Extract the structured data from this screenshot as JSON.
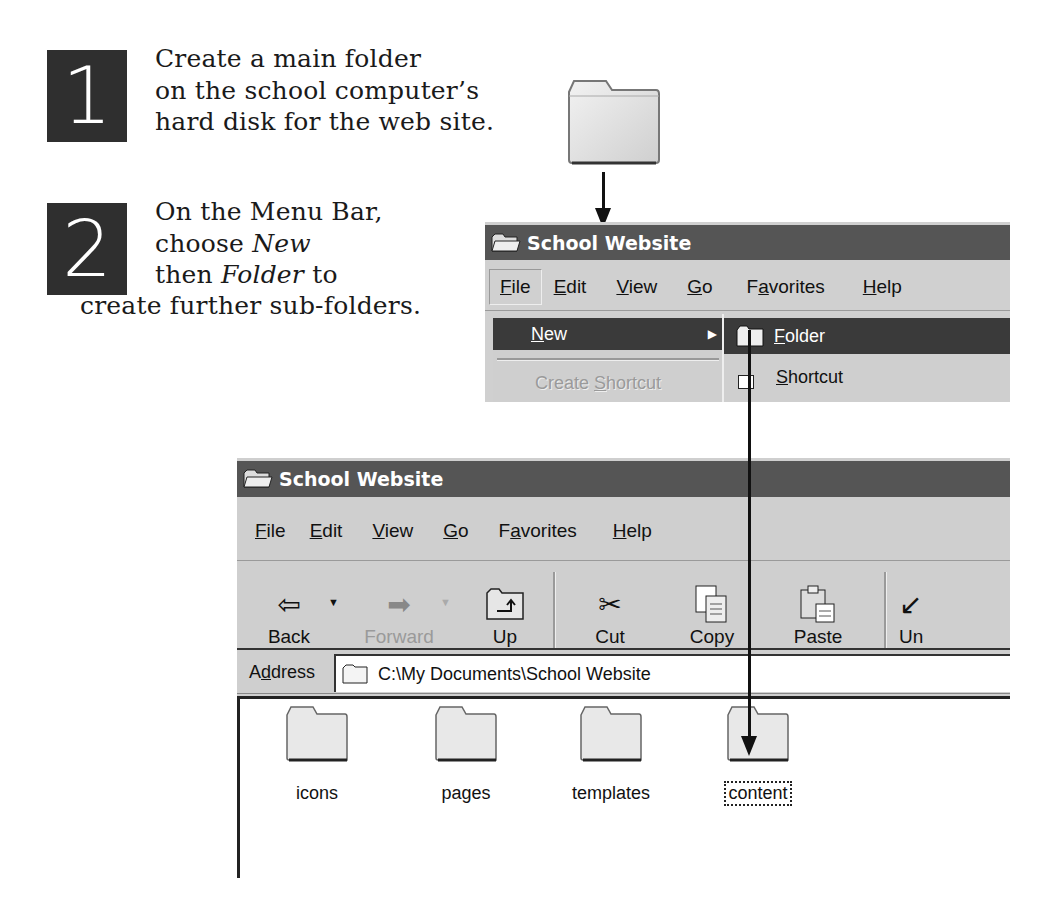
{
  "steps": [
    {
      "number": "1",
      "lines": [
        "Create a main folder",
        "on the school computer’s",
        "hard disk for the web site."
      ]
    },
    {
      "number": "2",
      "line1": "On the Menu Bar,",
      "line2_prefix": "choose ",
      "line2_em": "New",
      "line3_prefix": "then ",
      "line3_em": "Folder",
      "line3_suffix": " to",
      "line4": "create further sub-folders."
    }
  ],
  "main_folder_icon": "folder-icon",
  "window1": {
    "title": "School Website",
    "menu": [
      {
        "label": "File",
        "accel": "F",
        "rest": "ile"
      },
      {
        "label": "Edit",
        "accel": "E",
        "rest": "dit"
      },
      {
        "label": "View",
        "accel": "V",
        "rest": "iew"
      },
      {
        "label": "Go",
        "accel": "G",
        "rest": "o"
      },
      {
        "label": "Favorites",
        "pre": "F",
        "accel": "a",
        "rest": "vorites"
      },
      {
        "label": "Help",
        "accel": "H",
        "rest": "elp"
      }
    ],
    "file_menu": [
      {
        "label": "New",
        "accel": "N",
        "rest": "ew",
        "highlighted": true,
        "submenu": true
      },
      {
        "label": "Create Shortcut",
        "pre": "Create ",
        "accel": "S",
        "rest": "hortcut",
        "disabled": true
      }
    ],
    "new_submenu": [
      {
        "label": "Folder",
        "accel": "F",
        "rest": "older",
        "highlighted": true,
        "icon": "folder-icon"
      },
      {
        "label": "Shortcut",
        "accel": "S",
        "rest": "hortcut",
        "icon": "shortcut-icon"
      }
    ]
  },
  "window2": {
    "title": "School Website",
    "menu": [
      {
        "label": "File",
        "accel": "F",
        "rest": "ile"
      },
      {
        "label": "Edit",
        "accel": "E",
        "rest": "dit"
      },
      {
        "label": "View",
        "accel": "V",
        "rest": "iew"
      },
      {
        "label": "Go",
        "accel": "G",
        "rest": "o"
      },
      {
        "label": "Favorites",
        "pre": "F",
        "accel": "a",
        "rest": "vorites"
      },
      {
        "label": "Help",
        "accel": "H",
        "rest": "elp"
      }
    ],
    "toolbar": [
      {
        "label": "Back",
        "icon": "back-arrow-icon",
        "glyph": "⇦",
        "dropdown": true
      },
      {
        "label": "Forward",
        "icon": "forward-arrow-icon",
        "glyph": "➡",
        "dropdown": true,
        "disabled": true
      },
      {
        "label": "Up",
        "icon": "up-folder-icon",
        "glyph": "⮤"
      },
      {
        "label": "Cut",
        "icon": "scissors-icon",
        "glyph": "✂"
      },
      {
        "label": "Copy",
        "icon": "copy-icon",
        "glyph": "⎘"
      },
      {
        "label": "Paste",
        "icon": "paste-icon",
        "glyph": "📋"
      },
      {
        "label": "Un",
        "icon": "undo-icon",
        "glyph": "↙"
      }
    ],
    "address": {
      "label_pre": "A",
      "label_accel": "d",
      "label_rest": "dress",
      "value": "C:\\My Documents\\School Website"
    },
    "folders": [
      {
        "name": "icons"
      },
      {
        "name": "pages"
      },
      {
        "name": "templates"
      },
      {
        "name": "content",
        "selected": true
      }
    ]
  },
  "colors": {
    "number_box": "#2f2f2f",
    "titlebar": "#555555",
    "highlight": "#3a3a3a",
    "window_bg": "#c9c9c9"
  }
}
